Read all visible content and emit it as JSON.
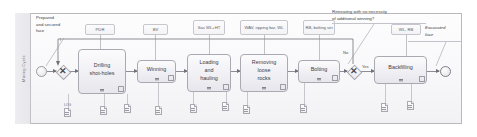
{
  "diagram": {
    "type": "bpmn-process",
    "pool": {
      "lane_label": "Mining Cycle"
    },
    "events": [
      {
        "name": "start-event",
        "label": ""
      },
      {
        "name": "end-event",
        "label": ""
      }
    ],
    "annotations": {
      "start_note": "Prepared\nand secured\nface",
      "end_note": "Excavated\nface",
      "gateway_question": "Retreating with no necessity\nof additional winning?"
    },
    "gateways": [
      {
        "name": "join-gateway",
        "symbol": "✕",
        "label": ""
      },
      {
        "name": "decision-gateway",
        "symbol": "✕",
        "label": "",
        "outgoing": [
          {
            "label": "No"
          },
          {
            "label": "Yes"
          }
        ]
      }
    ],
    "tasks": [
      {
        "id": "t1",
        "label": "Drilling\nshot-holes",
        "resources": "PDR"
      },
      {
        "id": "t2",
        "label": "Winning",
        "resources": "BV"
      },
      {
        "id": "t3",
        "label": "Loading\nand\nhauling",
        "resources": "Sas\nWL+HT"
      },
      {
        "id": "t4",
        "label": "Removing\nloose\nrocks",
        "resources": "WAV,\nripping bar, WL"
      },
      {
        "id": "t5",
        "label": "Bolting",
        "resources": "RB,\nbolting set"
      },
      {
        "id": "t6",
        "label": "Backfilling",
        "resources": "WL, RB"
      }
    ],
    "data_objects": [
      {
        "id": "d1",
        "label": "LOG"
      },
      {
        "id": "d2",
        "label": ""
      },
      {
        "id": "d3",
        "label": ""
      },
      {
        "id": "d4",
        "label": ""
      },
      {
        "id": "d5",
        "label": ""
      },
      {
        "id": "d6",
        "label": ""
      },
      {
        "id": "d7",
        "label": ""
      },
      {
        "id": "d8",
        "label": ""
      },
      {
        "id": "d9",
        "label": ""
      }
    ],
    "colors": {
      "pool_border": "#b9b9bd",
      "task_border": "#a9a9b2",
      "flow": "#8d8d94",
      "text": "#3c3c44"
    }
  }
}
